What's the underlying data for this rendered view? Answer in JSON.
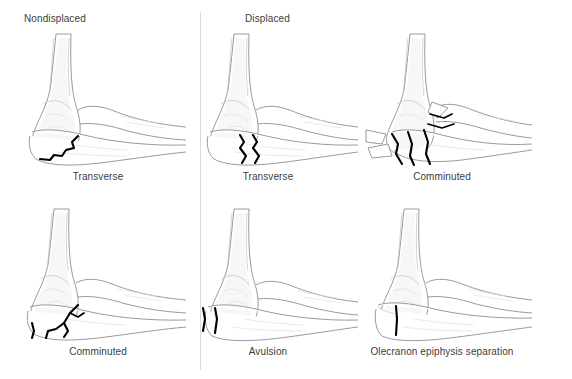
{
  "figure": {
    "title_hidden": "Olecranon fracture classification diagram",
    "columns": [
      {
        "id": "nondisplaced",
        "label": "Nondisplaced"
      },
      {
        "id": "displaced",
        "label": "Displaced"
      }
    ],
    "divider": {
      "present": true,
      "color": "#d9d9d9"
    },
    "colors": {
      "background": "#ffffff",
      "text": "#3c3c3c",
      "bone_outline": "#8f8f8f",
      "bone_detail": "#c2c2c2",
      "fracture_line": "#000000",
      "divider": "#d9d9d9"
    },
    "panels": [
      {
        "id": "nondisplaced-transverse",
        "caption": "Transverse",
        "column": "Nondisplaced",
        "row": 1,
        "fracture_pattern": "single jagged transverse line across olecranon, no separation"
      },
      {
        "id": "displaced-transverse",
        "caption": "Transverse",
        "column": "Displaced",
        "row": 1,
        "fracture_pattern": "two parallel jagged lines showing displaced gap across olecranon"
      },
      {
        "id": "displaced-comminuted",
        "caption": "Comminuted",
        "column": "Displaced",
        "row": 1,
        "fracture_pattern": "multiple fragments separated and displaced from olecranon"
      },
      {
        "id": "nondisplaced-comminuted",
        "caption": "Comminuted",
        "column": "Nondisplaced",
        "row": 2,
        "fracture_pattern": "branching multi-fragment fracture lines, fragments in place"
      },
      {
        "id": "displaced-avulsion",
        "caption": "Avulsion",
        "column": "Displaced",
        "row": 2,
        "fracture_pattern": "two short vertical lines at olecranon tip, small avulsed fragment"
      },
      {
        "id": "displaced-olecranon-epiphysis-separation",
        "caption": "Olecranon epiphysis separation",
        "column": "Displaced",
        "row": 2,
        "fracture_pattern": "single vertical line through olecranon physis"
      }
    ],
    "anatomy_labels": [
      "humerus",
      "trochlea",
      "olecranon",
      "ulna",
      "radius"
    ]
  }
}
